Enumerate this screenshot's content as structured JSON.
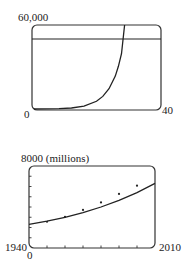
{
  "chart_data": [
    {
      "type": "line",
      "title": "",
      "xlabel": "",
      "ylabel": "",
      "xlim": [
        0,
        40
      ],
      "ylim": [
        0,
        60000
      ],
      "tick_labels": {
        "ymax": "60,000",
        "xmin": "0",
        "xmax": "40"
      },
      "series": [
        {
          "name": "exponential curve",
          "kind": "curve",
          "x": [
            0,
            4,
            8,
            12,
            16,
            20,
            22,
            24,
            26,
            27,
            28,
            29
          ],
          "y": [
            0,
            40,
            200,
            700,
            2000,
            5500,
            9000,
            14500,
            23500,
            30500,
            39500,
            60000
          ]
        },
        {
          "name": "horizontal line",
          "kind": "hline",
          "y": 50000
        }
      ],
      "grid": false
    },
    {
      "type": "line",
      "title": "",
      "xlabel": "",
      "ylabel": "",
      "xlim": [
        1940,
        2010
      ],
      "ylim": [
        0,
        8000
      ],
      "tick_labels": {
        "ymax": "8000 (millions)",
        "xmin": "1940",
        "xmax": "2010",
        "ymin": "0"
      },
      "x_ticks": [
        1950,
        1960,
        1970,
        1980,
        1990,
        2000
      ],
      "y_ticks": [
        1000,
        2000,
        3000,
        4000,
        5000,
        6000,
        7000
      ],
      "series": [
        {
          "name": "population model",
          "kind": "curve",
          "x": [
            1940,
            1950,
            1960,
            1970,
            1980,
            1990,
            2000,
            2010
          ],
          "y": [
            2300,
            2620,
            3000,
            3450,
            4000,
            4650,
            5400,
            6300
          ]
        },
        {
          "name": "data points",
          "kind": "points",
          "x": [
            1950,
            1960,
            1970,
            1980,
            1990,
            2000
          ],
          "y": [
            2560,
            3040,
            3710,
            4450,
            5280,
            6080
          ]
        }
      ],
      "grid": false
    }
  ]
}
